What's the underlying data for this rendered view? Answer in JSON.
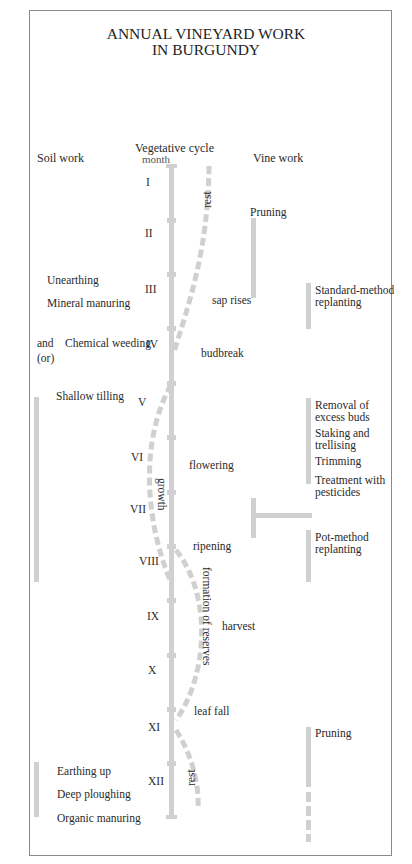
{
  "title": {
    "line1": "ANNUAL VINEYARD WORK",
    "line2": "IN BURGUNDY"
  },
  "columns": {
    "soil": "Soil work",
    "cycle": "Vegetative cycle",
    "month": "month",
    "vine": "Vine work"
  },
  "months": [
    "I",
    "II",
    "III",
    "IV",
    "V",
    "VI",
    "VII",
    "VIII",
    "IX",
    "X",
    "XI",
    "XII"
  ],
  "cycle_labels": {
    "rest_top": "rest",
    "sap": "sap rises",
    "budbreak": "budbreak",
    "growth": "growth",
    "flowering": "flowering",
    "ripening": "ripening",
    "reserves": "formation of reserves",
    "harvest": "harvest",
    "leaf_fall": "leaf fall",
    "rest_bottom": "rest"
  },
  "soil_work": {
    "unearthing": "Unearthing",
    "mineral": "Mineral manuring",
    "and": "and",
    "or": "(or)",
    "chemical": "Chemical weeding",
    "shallow": "Shallow tilling",
    "earthing": "Earthing up",
    "deep": "Deep ploughing",
    "organic": "Organic manuring"
  },
  "vine_work": {
    "pruning_top": "Pruning",
    "standard1": "Standard-method",
    "standard2": "replanting",
    "removal1": "Removal of",
    "removal2": "excess buds",
    "staking1": "Staking and",
    "staking2": "trellising",
    "trimming": "Trimming",
    "treat1": "Treatment with",
    "treat2": "pesticides",
    "pot1": "Pot-method",
    "pot2": "replanting",
    "pruning_bottom": "Pruning"
  },
  "colors": {
    "bar": "#d0d0d0",
    "text": "#2a2a2a",
    "border": "#8a8a8a"
  }
}
